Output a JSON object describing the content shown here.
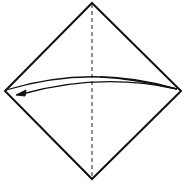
{
  "diagram": {
    "type": "origami-fold-step",
    "background": "#ffffff",
    "stroke": "#111111",
    "square": {
      "top": [
        92,
        3
      ],
      "right": [
        181,
        91
      ],
      "bottom": [
        92,
        179
      ],
      "left": [
        5,
        91
      ]
    },
    "crease": {
      "style": "dashed",
      "from": [
        92,
        3
      ],
      "to": [
        92,
        179
      ]
    },
    "arrow": {
      "from": "right-corner",
      "to": "left-corner",
      "style": "valley-fold"
    }
  }
}
